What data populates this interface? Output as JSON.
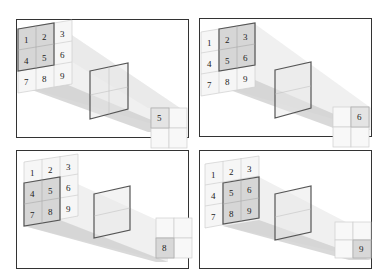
{
  "figure": {
    "panels": [
      {
        "id": "top-left",
        "input_grid": [
          "1",
          "2",
          "3",
          "4",
          "5",
          "6",
          "7",
          "8",
          "9"
        ],
        "highlighted": [
          "1",
          "2",
          "4",
          "5"
        ],
        "output_value": "5",
        "output_cell": "top-left"
      },
      {
        "id": "top-right",
        "input_grid": [
          "1",
          "2",
          "3",
          "4",
          "5",
          "6",
          "7",
          "8",
          "9"
        ],
        "highlighted": [
          "2",
          "3",
          "5",
          "6"
        ],
        "output_value": "6",
        "output_cell": "top-right"
      },
      {
        "id": "bottom-left",
        "input_grid": [
          "1",
          "2",
          "3",
          "4",
          "5",
          "6",
          "7",
          "8",
          "9"
        ],
        "highlighted": [
          "4",
          "5",
          "7",
          "8"
        ],
        "output_value": "8",
        "output_cell": "bottom-left"
      },
      {
        "id": "bottom-right",
        "input_grid": [
          "1",
          "2",
          "3",
          "4",
          "5",
          "6",
          "7",
          "8",
          "9"
        ],
        "highlighted": [
          "5",
          "6",
          "8",
          "9"
        ],
        "output_value": "9",
        "output_cell": "bottom-right"
      }
    ]
  },
  "colors": {
    "border": "#333333",
    "kernel_frame": "#555555",
    "grid_line": "#cccccc",
    "highlight_fill": "#d9d9d9",
    "beam_light": "#eeeeee",
    "beam_dark": "#c8c8c8"
  }
}
